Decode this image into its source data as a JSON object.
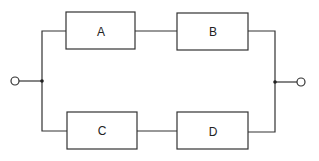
{
  "diagram": {
    "type": "series-parallel block diagram",
    "blocks": [
      {
        "id": "A",
        "label": "A",
        "branch": "upper",
        "position": 1
      },
      {
        "id": "B",
        "label": "B",
        "branch": "upper",
        "position": 2
      },
      {
        "id": "C",
        "label": "C",
        "branch": "lower",
        "position": 1
      },
      {
        "id": "D",
        "label": "D",
        "branch": "lower",
        "position": 2
      }
    ],
    "connections": [
      [
        "input",
        "A"
      ],
      [
        "A",
        "B"
      ],
      [
        "B",
        "output"
      ],
      [
        "input",
        "C"
      ],
      [
        "C",
        "D"
      ],
      [
        "D",
        "output"
      ]
    ],
    "terminals": [
      "input",
      "output"
    ],
    "line_color": "#333333"
  }
}
